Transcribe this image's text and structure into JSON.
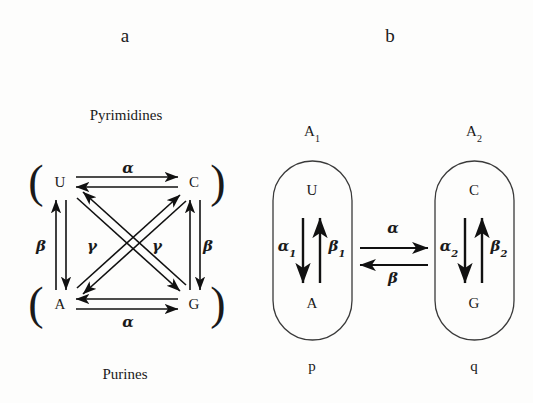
{
  "figure": {
    "panels": [
      {
        "id": "a",
        "letter": "a",
        "top_label": "Pyrimidines",
        "bottom_label": "Purines",
        "nodes": [
          {
            "id": "U",
            "label": "U"
          },
          {
            "id": "C",
            "label": "C"
          },
          {
            "id": "A",
            "label": "A"
          },
          {
            "id": "G",
            "label": "G"
          }
        ],
        "rate_labels": {
          "top_alpha": "α",
          "bottom_alpha": "α",
          "left_beta": "β",
          "right_beta": "β",
          "left_gamma": "γ",
          "right_gamma": "γ"
        },
        "brackets": {
          "top_left": "(",
          "top_right": ")",
          "bottom_left": "(",
          "bottom_right": ")"
        }
      },
      {
        "id": "b",
        "letter": "b",
        "groups": [
          {
            "id": "p",
            "top_label": "A",
            "top_label_sub": "1",
            "bottom_label": "p",
            "nodes": [
              {
                "id": "U",
                "label": "U"
              },
              {
                "id": "A",
                "label": "A"
              }
            ],
            "rate_down": "α",
            "rate_down_sub": "1",
            "rate_up": "β",
            "rate_up_sub": "1"
          },
          {
            "id": "q",
            "top_label": "A",
            "top_label_sub": "2",
            "bottom_label": "q",
            "nodes": [
              {
                "id": "C",
                "label": "C"
              },
              {
                "id": "G",
                "label": "G"
              }
            ],
            "rate_down": "α",
            "rate_down_sub": "2",
            "rate_up": "β",
            "rate_up_sub": "2"
          }
        ],
        "between": {
          "forward_rate": "α",
          "reverse_rate": "β"
        }
      }
    ],
    "colors": {
      "ink": "#1a1a1a",
      "line": "#111111",
      "capsule_stroke": "#3a3a3a",
      "background": "#fdfdfc"
    }
  }
}
